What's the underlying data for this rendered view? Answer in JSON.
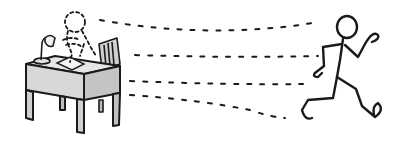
{
  "scene": {
    "description": "Cartoon of a person running away from a desk, leaving a dashed outline behind",
    "colors": {
      "ink": "#1a1a1a",
      "desk_fill": "#d8d8d8",
      "desk_side": "#c4c4c4",
      "paper": "#f4f4f4",
      "background": "#ffffff"
    },
    "elements": {
      "desk": "desk",
      "lamp": "desk lamp",
      "chair": "chair",
      "paper": "paper on desk",
      "ghost_figure": "dashed outline of seated person",
      "motion_lines": "dashed motion lines",
      "runner": "running stick figure"
    }
  }
}
